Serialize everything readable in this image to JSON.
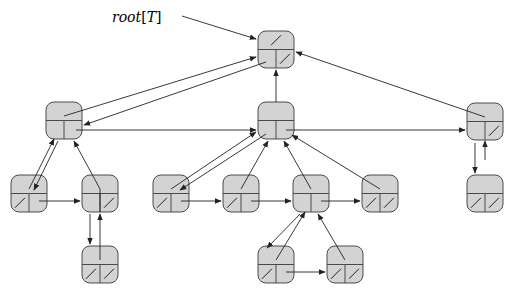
{
  "label": {
    "text": "root[T]",
    "prefix": "root",
    "bracket_open": "[",
    "var": "T",
    "bracket_close": "]",
    "x": 112,
    "y": 22
  },
  "node_size": {
    "w": 36,
    "h": 37,
    "radius": 8
  },
  "colors": {
    "fill": "#d3d3d3",
    "stroke": "#4a4a4a",
    "line": "#222222"
  },
  "nodes": [
    {
      "id": "root",
      "x": 258,
      "y": 31,
      "p_nil": true,
      "lc_nil": false,
      "rs_nil": true
    },
    {
      "id": "A",
      "x": 46,
      "y": 102,
      "p_nil": false,
      "lc_nil": false,
      "rs_nil": false
    },
    {
      "id": "B",
      "x": 258,
      "y": 102,
      "p_nil": false,
      "lc_nil": false,
      "rs_nil": false
    },
    {
      "id": "C",
      "x": 467,
      "y": 103,
      "p_nil": false,
      "lc_nil": false,
      "rs_nil": true
    },
    {
      "id": "D",
      "x": 11,
      "y": 175,
      "p_nil": false,
      "lc_nil": true,
      "rs_nil": false
    },
    {
      "id": "E",
      "x": 82,
      "y": 175,
      "p_nil": false,
      "lc_nil": false,
      "rs_nil": true
    },
    {
      "id": "F",
      "x": 153,
      "y": 175,
      "p_nil": false,
      "lc_nil": true,
      "rs_nil": false
    },
    {
      "id": "G",
      "x": 223,
      "y": 175,
      "p_nil": false,
      "lc_nil": true,
      "rs_nil": false
    },
    {
      "id": "H",
      "x": 293,
      "y": 175,
      "p_nil": false,
      "lc_nil": false,
      "rs_nil": false
    },
    {
      "id": "I",
      "x": 362,
      "y": 175,
      "p_nil": false,
      "lc_nil": true,
      "rs_nil": true
    },
    {
      "id": "J",
      "x": 467,
      "y": 175,
      "p_nil": false,
      "lc_nil": true,
      "rs_nil": true
    },
    {
      "id": "K",
      "x": 82,
      "y": 246,
      "p_nil": false,
      "lc_nil": true,
      "rs_nil": true
    },
    {
      "id": "L",
      "x": 258,
      "y": 246,
      "p_nil": false,
      "lc_nil": true,
      "rs_nil": false
    },
    {
      "id": "M",
      "x": 327,
      "y": 246,
      "p_nil": false,
      "lc_nil": true,
      "rs_nil": true
    }
  ],
  "edges": [
    {
      "from": [
        182,
        16
      ],
      "to": [
        256,
        39
      ],
      "kind": "root-pointer"
    },
    {
      "from": [
        64,
        116
      ],
      "to": [
        256,
        57
      ],
      "kind": "parent"
    },
    {
      "from": [
        266,
        62
      ],
      "to": [
        84,
        125
      ],
      "kind": "left-child"
    },
    {
      "from": [
        276,
        102
      ],
      "to": [
        276,
        70
      ],
      "kind": "parent"
    },
    {
      "from": [
        485,
        117
      ],
      "to": [
        296,
        52
      ],
      "kind": "parent"
    },
    {
      "from": [
        76,
        130
      ],
      "to": [
        256,
        130
      ],
      "kind": "right-sibling"
    },
    {
      "from": [
        286,
        130
      ],
      "to": [
        465,
        130
      ],
      "kind": "right-sibling"
    },
    {
      "from": [
        29,
        189
      ],
      "to": [
        54,
        139
      ],
      "kind": "parent"
    },
    {
      "from": [
        58,
        141
      ],
      "to": [
        34,
        190
      ],
      "kind": "left-child"
    },
    {
      "from": [
        100,
        189
      ],
      "to": [
        74,
        141
      ],
      "kind": "parent"
    },
    {
      "from": [
        39,
        201
      ],
      "to": [
        80,
        201
      ],
      "kind": "right-sibling"
    },
    {
      "from": [
        171,
        189
      ],
      "to": [
        256,
        132
      ],
      "kind": "parent"
    },
    {
      "from": [
        266,
        134
      ],
      "to": [
        180,
        190
      ],
      "kind": "left-child"
    },
    {
      "from": [
        241,
        189
      ],
      "to": [
        268,
        141
      ],
      "kind": "parent"
    },
    {
      "from": [
        181,
        201
      ],
      "to": [
        221,
        201
      ],
      "kind": "right-sibling"
    },
    {
      "from": [
        311,
        189
      ],
      "to": [
        284,
        141
      ],
      "kind": "parent"
    },
    {
      "from": [
        251,
        201
      ],
      "to": [
        291,
        201
      ],
      "kind": "right-sibling"
    },
    {
      "from": [
        380,
        189
      ],
      "to": [
        292,
        135
      ],
      "kind": "parent"
    },
    {
      "from": [
        321,
        201
      ],
      "to": [
        360,
        201
      ],
      "kind": "right-sibling"
    },
    {
      "from": [
        485,
        160
      ],
      "to": [
        485,
        141
      ],
      "kind": "parent"
    },
    {
      "from": [
        475,
        143
      ],
      "to": [
        475,
        173
      ],
      "kind": "left-child"
    },
    {
      "from": [
        100,
        189
      ],
      "to": [
        100,
        212
      ],
      "kind": "none"
    },
    {
      "from": [
        100,
        260
      ],
      "to": [
        100,
        214
      ],
      "kind": "parent"
    },
    {
      "from": [
        90,
        214
      ],
      "to": [
        90,
        244
      ],
      "kind": "left-child"
    },
    {
      "from": [
        276,
        260
      ],
      "to": [
        305,
        212
      ],
      "kind": "parent"
    },
    {
      "from": [
        300,
        214
      ],
      "to": [
        267,
        248
      ],
      "kind": "left-child"
    },
    {
      "from": [
        345,
        260
      ],
      "to": [
        318,
        214
      ],
      "kind": "parent"
    },
    {
      "from": [
        286,
        272
      ],
      "to": [
        325,
        272
      ],
      "kind": "right-sibling"
    }
  ]
}
